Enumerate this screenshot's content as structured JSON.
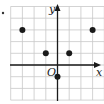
{
  "diagram": {
    "type": "coordinate-grid",
    "axes": {
      "x_label": "x",
      "y_label": "y",
      "origin_label": "O"
    },
    "grid": {
      "x_range": [
        -4,
        4
      ],
      "y_range": [
        -3,
        5
      ],
      "unit_px": 11.7
    },
    "points": [
      {
        "x": -3,
        "y": 3
      },
      {
        "x": -1,
        "y": 1
      },
      {
        "x": 1,
        "y": 1
      },
      {
        "x": 3,
        "y": 3
      },
      {
        "x": 0,
        "y": -1
      }
    ],
    "bullet_marker": "•",
    "colors": {
      "grid": "#c8c8c8",
      "axis": "#1a1a1a",
      "point": "#1a1a1a"
    }
  }
}
